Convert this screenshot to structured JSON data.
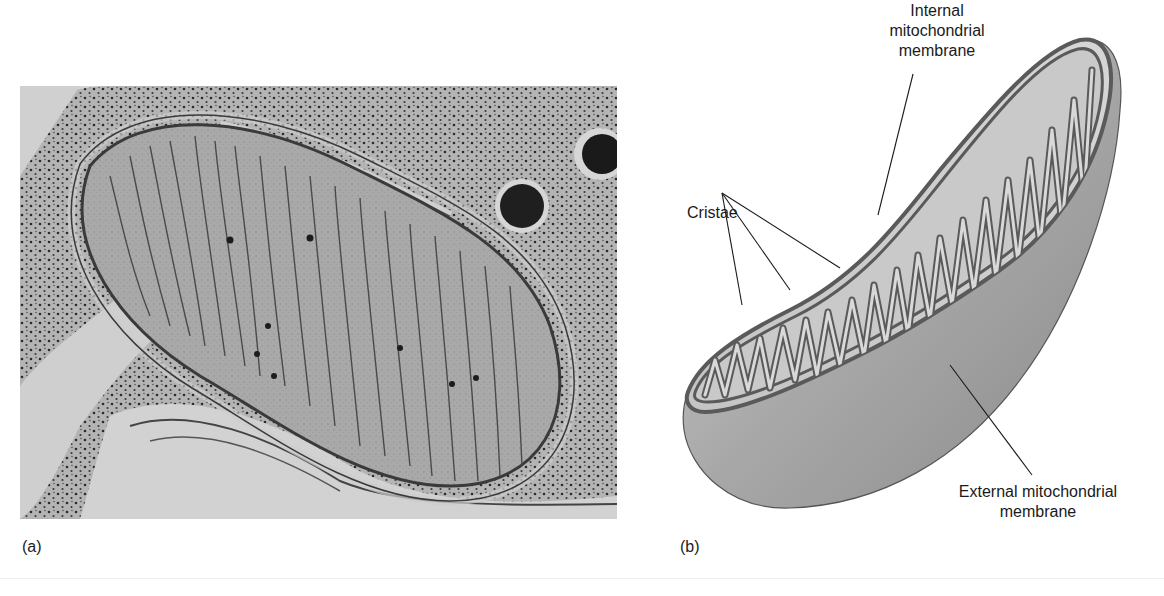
{
  "figure": {
    "panels": [
      {
        "id": "a",
        "caption": "(a)",
        "kind": "electron-micrograph",
        "subject": "mitochondrion"
      },
      {
        "id": "b",
        "caption": "(b)",
        "kind": "schematic-diagram",
        "subject": "mitochondrion cutaway",
        "labels": {
          "internal_line1": "Internal",
          "internal_line2": "mitochondrial",
          "internal_line3": "membrane",
          "cristae": "Cristae",
          "external_line1": "External mitochondrial",
          "external_line2": "membrane"
        }
      }
    ]
  },
  "colors": {
    "background": "#ffffff",
    "micrograph_bg": "#bdbdbd",
    "membrane": "#5a5a5a",
    "matrix": "#c9c9c9",
    "outer_body": "#9a9a9a",
    "text": "#1a1a1a"
  }
}
